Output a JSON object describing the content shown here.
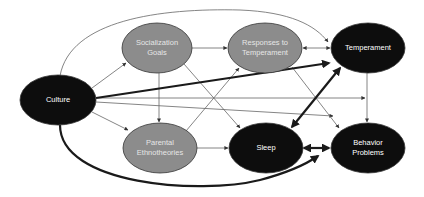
{
  "diagram": {
    "nodes": [
      {
        "id": "culture",
        "label": "Culture",
        "fill": "#0d0d0d",
        "text_color": "#ffffff",
        "cx": 58,
        "cy": 100,
        "rx": 38,
        "ry": 25
      },
      {
        "id": "socialization_goals",
        "label": "Socialization\nGoals",
        "fill": "#8c8c8c",
        "text_color": "#e6e6e6",
        "cx": 157,
        "cy": 48,
        "rx": 35,
        "ry": 25
      },
      {
        "id": "responses_to_temperament",
        "label": "Responses to\nTemperament",
        "fill": "#8c8c8c",
        "text_color": "#e6e6e6",
        "cx": 265,
        "cy": 48,
        "rx": 37,
        "ry": 25
      },
      {
        "id": "temperament",
        "label": "Temperament",
        "fill": "#0d0d0d",
        "text_color": "#ffffff",
        "cx": 368,
        "cy": 48,
        "rx": 37,
        "ry": 25
      },
      {
        "id": "parental_ethnotheories",
        "label": "Parental\nEthnotheories",
        "fill": "#8c8c8c",
        "text_color": "#e6e6e6",
        "cx": 160,
        "cy": 148,
        "rx": 37,
        "ry": 25
      },
      {
        "id": "sleep",
        "label": "Sleep",
        "fill": "#0d0d0d",
        "text_color": "#ffffff",
        "cx": 266,
        "cy": 148,
        "rx": 37,
        "ry": 25
      },
      {
        "id": "behavior_problems",
        "label": "Behavior\nProblems",
        "fill": "#0d0d0d",
        "text_color": "#ffffff",
        "cx": 368,
        "cy": 148,
        "rx": 37,
        "ry": 25
      }
    ],
    "edges": [
      {
        "from": "culture",
        "to": "socialization_goals",
        "weight": "thin"
      },
      {
        "from": "culture",
        "to": "parental_ethnotheories",
        "weight": "thin"
      },
      {
        "from": "culture",
        "to": "temperament",
        "weight": "thin",
        "shape": "top-arc"
      },
      {
        "from": "culture",
        "to": "temperament",
        "weight": "thick"
      },
      {
        "from": "culture",
        "to": "temperament-behavior_problems-path",
        "weight": "thin"
      },
      {
        "from": "culture",
        "to": "behavior_problems",
        "weight": "thin"
      },
      {
        "from": "culture",
        "to": "sleep",
        "weight": "thick",
        "shape": "bottom-arc"
      },
      {
        "from": "socialization_goals",
        "to": "responses_to_temperament",
        "weight": "thin"
      },
      {
        "from": "socialization_goals",
        "to": "parental_ethnotheories",
        "weight": "thin"
      },
      {
        "from": "socialization_goals",
        "to": "sleep",
        "weight": "thin"
      },
      {
        "from": "parental_ethnotheories",
        "to": "responses_to_temperament",
        "weight": "thin"
      },
      {
        "from": "parental_ethnotheories",
        "to": "sleep",
        "weight": "thin"
      },
      {
        "from": "responses_to_temperament",
        "to": "temperament",
        "weight": "thin",
        "bidirectional": true
      },
      {
        "from": "responses_to_temperament",
        "to": "behavior_problems",
        "weight": "thin"
      },
      {
        "from": "temperament",
        "to": "behavior_problems",
        "weight": "thin"
      },
      {
        "from": "sleep",
        "to": "temperament",
        "weight": "thick",
        "bidirectional": true
      },
      {
        "from": "sleep",
        "to": "behavior_problems",
        "weight": "thick",
        "bidirectional": true
      }
    ],
    "colors": {
      "dark_node": "#0d0d0d",
      "gray_node": "#8c8c8c",
      "thin_line": "#666666",
      "thick_line": "#1a1a1a"
    }
  }
}
